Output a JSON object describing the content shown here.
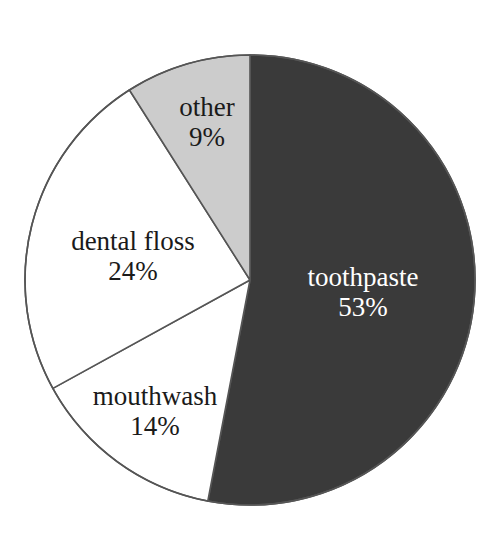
{
  "chart_data": {
    "type": "pie",
    "title": "",
    "subtitle": "",
    "xlabel": "",
    "ylabel": "",
    "legend_position": "none",
    "grid": false,
    "labels_inside_slices": true,
    "start_angle_deg": 0,
    "direction": "clockwise",
    "categories": [
      "toothpaste",
      "mouthwash",
      "dental floss",
      "other"
    ],
    "values": [
      53,
      14,
      24,
      9
    ],
    "value_suffix": "%",
    "slices": [
      {
        "label": "toothpaste",
        "value": 53,
        "value_text": "53%",
        "fill": "#3a3a3a",
        "text_color": "#ffffff",
        "start_deg": 0,
        "end_deg": 190.8,
        "label_x": 363,
        "label_y": 292
      },
      {
        "label": "mouthwash",
        "value": 14,
        "value_text": "14%",
        "fill": "#ffffff",
        "text_color": "#1a1a1a",
        "start_deg": 190.8,
        "end_deg": 241.2,
        "label_x": 155,
        "label_y": 411
      },
      {
        "label": "dental floss",
        "value": 24,
        "value_text": "24%",
        "fill": "#ffffff",
        "text_color": "#1a1a1a",
        "start_deg": 241.2,
        "end_deg": 327.6,
        "label_x": 133,
        "label_y": 256
      },
      {
        "label": "other",
        "value": 9,
        "value_text": "9%",
        "fill": "#cccccc",
        "text_color": "#1a1a1a",
        "start_deg": 327.6,
        "end_deg": 360,
        "label_x": 207,
        "label_y": 122
      }
    ],
    "geometry": {
      "center_x": 250,
      "center_y": 280,
      "radius": 225,
      "outline_color": "#555555",
      "outline_width": 1.6
    },
    "colors": {
      "background": "#ffffff",
      "toothpaste": "#3a3a3a",
      "mouthwash": "#ffffff",
      "dental_floss": "#ffffff",
      "other": "#cccccc",
      "outline": "#555555",
      "text_dark": "#1a1a1a",
      "text_light": "#ffffff"
    }
  }
}
